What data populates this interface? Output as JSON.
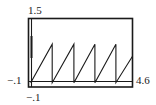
{
  "chart_data": {
    "type": "line",
    "title": "",
    "xlabel": "",
    "ylabel": "",
    "xlim": [
      -0.1,
      4.6
    ],
    "ylim": [
      -0.1,
      1.5
    ],
    "grid": false,
    "legend": null,
    "tick_labels": {
      "x_min": "−.1",
      "x_max": "4.6",
      "y_min": "−.1",
      "y_max": "1.5"
    },
    "series": [
      {
        "name": "sawtooth",
        "description": "Sawtooth wave, period 1, rising linearly from 0 to ~0.9 then dropping back to 0",
        "x": [
          0,
          0.97,
          0.97,
          1.95,
          1.95,
          2.9,
          2.9,
          3.85,
          3.85,
          4.6
        ],
        "y": [
          0,
          0.9,
          0,
          0.9,
          0,
          0.9,
          0,
          0.9,
          0,
          0.62
        ]
      }
    ],
    "colors": {
      "line": "#1a1a1a",
      "frame": "#1a1a1a",
      "background": "#ffffff"
    }
  }
}
